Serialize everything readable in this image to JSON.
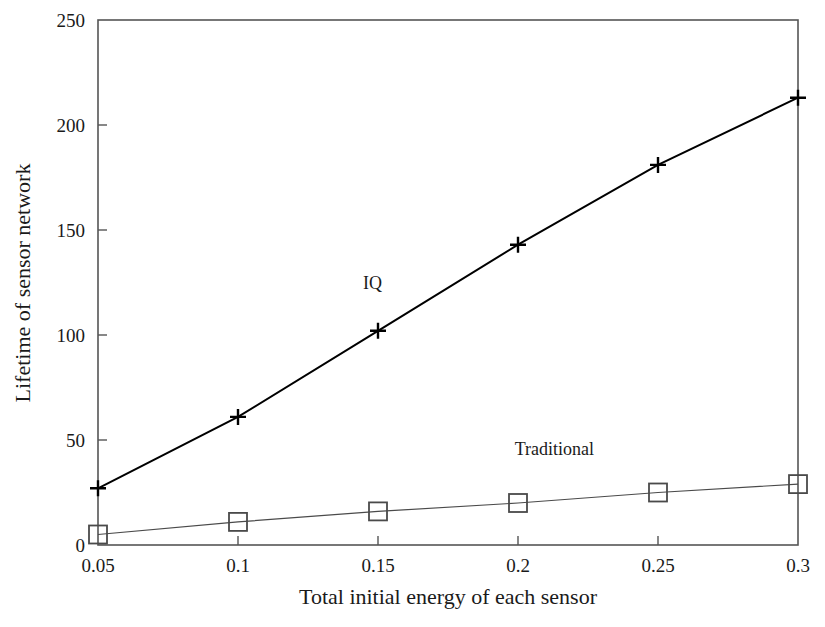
{
  "chart_data": {
    "type": "line",
    "title": "",
    "xlabel": "Total initial energy of each sensor",
    "ylabel": "Lifetime of sensor network",
    "x": [
      0.05,
      0.1,
      0.15,
      0.2,
      0.25,
      0.3
    ],
    "xticklabels": [
      "0.05",
      "0.1",
      "0.15",
      "0.2",
      "0.25",
      "0.3"
    ],
    "yticks": [
      0,
      50,
      100,
      150,
      200,
      250
    ],
    "yticklabels": [
      "0",
      "50",
      "100",
      "150",
      "200",
      "250"
    ],
    "xlim": [
      0.05,
      0.3
    ],
    "ylim": [
      0,
      250
    ],
    "grid": false,
    "legend_position": "inline-annotations",
    "series": [
      {
        "name": "IQ",
        "marker": "plus",
        "color": "#000000",
        "linewidth": 2.0,
        "values": [
          27,
          61,
          102,
          143,
          181,
          213
        ],
        "annotation": {
          "text": "IQ",
          "x": 0.148,
          "y": 122
        }
      },
      {
        "name": "Traditional",
        "marker": "square",
        "color": "#4a4a4a",
        "linewidth": 1.2,
        "values": [
          5,
          11,
          16,
          20,
          25,
          29
        ],
        "annotation": {
          "text": "Traditional",
          "x": 0.213,
          "y": 43
        }
      }
    ]
  },
  "axes": {
    "frame_color": "#555555",
    "tick_color": "#555555"
  }
}
